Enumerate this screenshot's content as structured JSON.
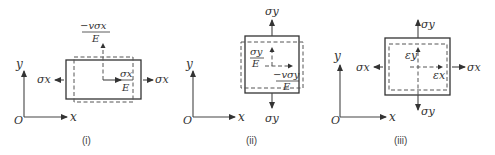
{
  "figure": {
    "panels": [
      {
        "caption": "(i)",
        "axes": {
          "origin": "O",
          "x": "x",
          "y": "y"
        },
        "stress_left": "σx",
        "stress_right": "σx",
        "transverse_strain_num": "−vσx",
        "transverse_strain_den": "E",
        "axial_strain_num": "σx",
        "axial_strain_den": "E"
      },
      {
        "caption": "(ii)",
        "axes": {
          "origin": "O",
          "x": "x",
          "y": "y"
        },
        "stress_top": "σy",
        "stress_bottom": "σy",
        "axial_strain_num": "σy",
        "axial_strain_den": "E",
        "transverse_strain_num": "−vσy",
        "transverse_strain_den": "E"
      },
      {
        "caption": "(iii)",
        "axes": {
          "origin": "O",
          "x": "x",
          "y": "y"
        },
        "stress_left": "σx",
        "stress_right": "σx",
        "stress_top": "σy",
        "stress_bottom": "σy",
        "strain_y": "εy",
        "strain_x": "εx"
      }
    ]
  }
}
